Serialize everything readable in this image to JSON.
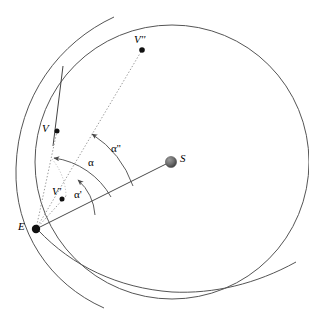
{
  "figure": {
    "title": "",
    "background_color": "#ffffff",
    "stroke_color": "#3a3a3a",
    "dotted_color": "#8c8c8c",
    "point_color": "#000000",
    "sun_color": "#6b6b6b",
    "width": 309,
    "height": 325
  },
  "labels": {
    "sun": "S",
    "earth": "E",
    "vertex": "V",
    "vertex_prime": "V'",
    "vertex_double_prime": "V''",
    "angle": "α",
    "angle_prime": "α'",
    "angle_double_prime": "α''"
  },
  "points": {
    "E": {
      "x": 36,
      "y": 229,
      "label": "E",
      "label_x": 18,
      "label_y": 222
    },
    "S": {
      "x": 171,
      "y": 162,
      "label": "S",
      "label_x": 181,
      "label_y": 155
    },
    "V": {
      "x": 57,
      "y": 131,
      "label": "V",
      "label_x": 41,
      "label_y": 124
    },
    "Vp": {
      "x": 65,
      "y": 196,
      "label": "V'",
      "label_x": 54,
      "label_y": 183
    },
    "Vpp": {
      "x": 142,
      "y": 50,
      "label": "V''",
      "label_x": 133,
      "label_y": 36
    }
  },
  "circles": {
    "orbit_inner": {
      "cx": 172,
      "cy": 162,
      "r": 115,
      "kind": "full",
      "name": "inner-orbit"
    },
    "orbit_outer": {
      "cx": 175,
      "cy": 175,
      "r": 160,
      "kind": "arc",
      "name": "outer-orbit",
      "start_deg": 112,
      "end_deg": 260
    }
  },
  "angle_arcs": [
    {
      "name": "alpha",
      "label": "α",
      "radius": 58,
      "label_x": 88,
      "label_y": 158
    },
    {
      "name": "alpha-prime",
      "label": "α'",
      "radius": 36,
      "label_x": 74,
      "label_y": 190
    },
    {
      "name": "alpha-double-prime",
      "label": "α''",
      "radius": 86,
      "label_x": 112,
      "label_y": 144
    }
  ],
  "lines": {
    "E_to_S": {
      "style": "solid"
    },
    "E_to_V": {
      "style": "dotted"
    },
    "E_to_Vp": {
      "style": "dotted"
    },
    "E_to_Vpp": {
      "style": "dotted"
    },
    "tangent": {
      "style": "solid"
    }
  }
}
